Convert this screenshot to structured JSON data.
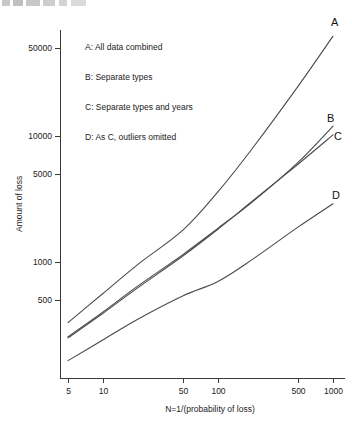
{
  "figure": {
    "top_cropped_text_fragment": "",
    "background_color": "#ffffff",
    "line_color": "#4a4a4a"
  },
  "chart_data": {
    "type": "line",
    "title": "",
    "xlabel": "N=1/(probability of loss)",
    "ylabel": "Amount of loss",
    "xscale": "log",
    "yscale": "log",
    "xlim": [
      5,
      1000
    ],
    "ylim": [
      150,
      80000
    ],
    "grid": false,
    "legend_position": "upper-left-inside",
    "xticks": [
      5,
      10,
      50,
      100,
      500,
      1000
    ],
    "xtick_labels": [
      "5",
      "10",
      "50",
      "100",
      "500",
      "1000"
    ],
    "yticks": [
      500,
      1000,
      5000,
      10000,
      50000
    ],
    "ytick_labels": [
      "500",
      "1000",
      "5000",
      "10000",
      "50000"
    ],
    "series": [
      {
        "name": "A",
        "label": "A: All data combined",
        "end_label": "A",
        "x": [
          5,
          10,
          20,
          50,
          100,
          200,
          500,
          1000
        ],
        "y": [
          330,
          560,
          950,
          1800,
          3600,
          8000,
          25000,
          62000
        ]
      },
      {
        "name": "B",
        "label": "B: Separate types",
        "end_label": "B",
        "x": [
          5,
          10,
          20,
          50,
          100,
          200,
          500,
          1000
        ],
        "y": [
          255,
          400,
          640,
          1150,
          1850,
          3000,
          6200,
          12000
        ]
      },
      {
        "name": "C",
        "label": "C: Separate types and years",
        "end_label": "C",
        "x": [
          5,
          10,
          20,
          50,
          100,
          200,
          500,
          1000
        ],
        "y": [
          250,
          390,
          620,
          1120,
          1820,
          3050,
          6000,
          10200
        ]
      },
      {
        "name": "D",
        "label": "D: As C, outliers omitted",
        "end_label": "D",
        "x": [
          5,
          10,
          20,
          50,
          100,
          200,
          500,
          1000
        ],
        "y": [
          165,
          240,
          350,
          540,
          700,
          1050,
          1900,
          2900
        ]
      }
    ],
    "legend_entries": [
      "A: All data combined",
      "B: Separate types",
      "C: Separate types and years",
      "D: As C, outliers omitted"
    ]
  }
}
